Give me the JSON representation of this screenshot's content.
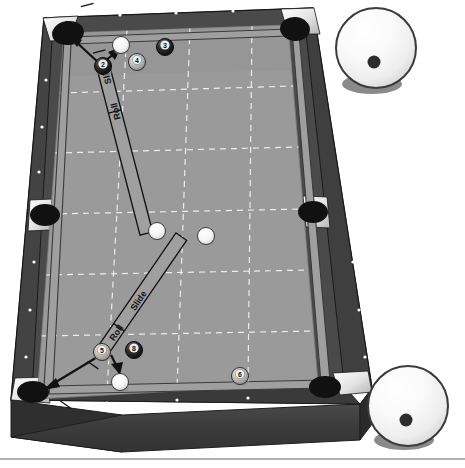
{
  "figure": {
    "type": "illustration",
    "background_color": "#ffffff",
    "bottom_rule_color": "#9a9a9a"
  },
  "table": {
    "name": "billiard-table",
    "cloth_color": "#9a9a9a",
    "cloth_shadow_color": "#8d8d8d",
    "rail_top_color": "#a9a9a9",
    "rail_side_color": "#4a4a4a",
    "wood_skirt_color": "#3d3d3d",
    "wood_skirt_edge_color": "#2b2b2b",
    "pocket_color": "#111111",
    "pocket_plate_color": "#f0f0f0",
    "grid_line_color": "#f2f2f2",
    "diamond_color": "#ffffff",
    "grid_rows": 5,
    "grid_cols": 3,
    "pockets": [
      {
        "name": "pocket-top-left"
      },
      {
        "name": "pocket-top-right"
      },
      {
        "name": "pocket-side-left"
      },
      {
        "name": "pocket-side-right"
      },
      {
        "name": "pocket-bottom-left"
      },
      {
        "name": "pocket-bottom-right"
      }
    ]
  },
  "balls": [
    {
      "name": "ball-2",
      "label": "2",
      "style": "solid-dark",
      "x": 103,
      "y": 66
    },
    {
      "name": "ball-3",
      "label": "3",
      "style": "solid-dark",
      "x": 165,
      "y": 47
    },
    {
      "name": "ball-4",
      "label": "4",
      "style": "solid-light",
      "x": 137,
      "y": 62
    },
    {
      "name": "ball-5",
      "label": "5",
      "style": "solid-light",
      "x": 102,
      "y": 352
    },
    {
      "name": "ball-8",
      "label": "8",
      "style": "solid-dark",
      "x": 134,
      "y": 350
    },
    {
      "name": "ball-6",
      "label": "6",
      "style": "solid-light",
      "x": 240,
      "y": 376
    }
  ],
  "cue_balls_on_table": [
    {
      "name": "cue-ball-upper-start",
      "x": 121,
      "y": 45
    },
    {
      "name": "cue-ball-upper-end",
      "x": 157,
      "y": 231
    },
    {
      "name": "cue-ball-lower-start",
      "x": 206,
      "y": 236
    },
    {
      "name": "cue-ball-lower-end",
      "x": 120,
      "y": 382
    }
  ],
  "motion_strips": [
    {
      "name": "upper-motion-strip",
      "segments": [
        {
          "name": "segment-roll-upper",
          "label": "Roll"
        },
        {
          "name": "segment-slide-upper",
          "label": "Slide"
        }
      ]
    },
    {
      "name": "lower-motion-strip",
      "segments": [
        {
          "name": "segment-roll-lower",
          "label": "Roll"
        },
        {
          "name": "segment-slide-lower",
          "label": "Slide"
        }
      ]
    }
  ],
  "arrows": [
    {
      "name": "arrow-object-ball-upper-to-pocket"
    },
    {
      "name": "arrow-cue-ball-upper-deflect"
    },
    {
      "name": "arrow-object-ball-lower-to-pocket"
    },
    {
      "name": "arrow-cue-ball-lower-deflect"
    }
  ],
  "cue_ball_insets": [
    {
      "name": "cue-ball-inset-top-right",
      "ball_color": "#fbfbfb",
      "outline_color": "#3a3a3a",
      "contact_dot_color": "#2d2d2d",
      "shadow_color": "#8a8a8a",
      "contact_point": "below-center"
    },
    {
      "name": "cue-ball-inset-bottom-right",
      "ball_color": "#fbfbfb",
      "outline_color": "#3a3a3a",
      "contact_dot_color": "#2d2d2d",
      "shadow_color": "#8a8a8a",
      "contact_point": "below-center"
    }
  ]
}
